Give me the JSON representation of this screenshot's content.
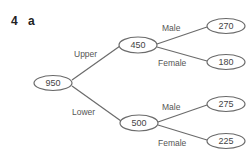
{
  "question": {
    "number": "4",
    "part": "a"
  },
  "tree": {
    "root": {
      "value": "950"
    },
    "branches": [
      {
        "label": "Upper",
        "node": {
          "value": "450"
        },
        "children": [
          {
            "label": "Male",
            "value": "270"
          },
          {
            "label": "Female",
            "value": "180"
          }
        ]
      },
      {
        "label": "Lower",
        "node": {
          "value": "500"
        },
        "children": [
          {
            "label": "Male",
            "value": "275"
          },
          {
            "label": "Female",
            "value": "225"
          }
        ]
      }
    ]
  },
  "colors": {
    "line": "#666666",
    "text": "#444444"
  }
}
